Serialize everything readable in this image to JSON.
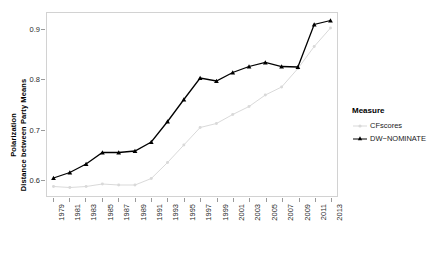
{
  "chart_data": {
    "type": "line",
    "title": "",
    "xlabel": "",
    "ylabel_line1": "Polarization",
    "ylabel_line2": "Distance between Party Means",
    "x": [
      1979,
      1981,
      1983,
      1985,
      1987,
      1989,
      1991,
      1993,
      1995,
      1997,
      1999,
      2001,
      2003,
      2005,
      2007,
      2009,
      2011,
      2013
    ],
    "xtick_labels": [
      "1979",
      "1981",
      "1983",
      "1985",
      "1987",
      "1989",
      "1991",
      "1993",
      "1995",
      "1997",
      "1999",
      "2001",
      "2003",
      "2005",
      "2007",
      "2009",
      "2011",
      "2013"
    ],
    "ytick_labels": [
      "0.6",
      "0.7",
      "0.8",
      "0.9"
    ],
    "ytick_values": [
      0.6,
      0.7,
      0.8,
      0.9
    ],
    "xlim": [
      1978.2,
      2013.8
    ],
    "ylim": [
      0.567,
      0.933
    ],
    "grid": false,
    "legend_position": "right",
    "series": [
      {
        "name": "CFscores",
        "color": "#d9d9d9",
        "marker": "circle",
        "values": [
          0.586,
          0.584,
          0.586,
          0.591,
          0.589,
          0.589,
          0.602,
          0.634,
          0.669,
          0.704,
          0.712,
          0.73,
          0.746,
          0.769,
          0.785,
          0.822,
          0.866,
          0.903
        ]
      },
      {
        "name": "DW-NOMINATE",
        "color": "#000000",
        "marker": "triangle",
        "values": [
          0.603,
          0.614,
          0.631,
          0.654,
          0.654,
          0.657,
          0.675,
          0.716,
          0.76,
          0.803,
          0.797,
          0.814,
          0.826,
          0.834,
          0.826,
          0.825,
          0.91,
          0.918
        ]
      }
    ]
  },
  "legend": {
    "title": "Measure",
    "items": [
      {
        "label": "CFscores"
      },
      {
        "label": "DW−NOMINATE"
      }
    ]
  }
}
